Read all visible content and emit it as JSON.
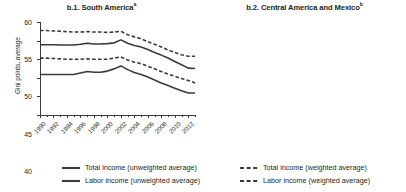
{
  "chart_data": [
    {
      "type": "line",
      "title": "b.1. South America",
      "title_superscript": "a",
      "xlabel": "",
      "ylabel": "Gini points, average",
      "ylim": [
        35,
        60
      ],
      "yticks": [
        35,
        40,
        45,
        50,
        55,
        60
      ],
      "xlim": [
        1990,
        2013
      ],
      "x": [
        1990,
        1991,
        1992,
        1993,
        1994,
        1995,
        1996,
        1997,
        1998,
        1999,
        2000,
        2001,
        2002,
        2003,
        2004,
        2005,
        2006,
        2007,
        2008,
        2009,
        2010,
        2011,
        2012,
        2013
      ],
      "xticks": [
        1990,
        1992,
        1994,
        1996,
        1998,
        2000,
        2002,
        2004,
        2006,
        2008,
        2010,
        2012
      ],
      "xtick_labels": [
        "1990",
        "1992",
        "1994",
        "1996",
        "1998",
        "2000",
        "2002",
        "2004",
        "2006",
        "2008",
        "2010",
        "2012"
      ],
      "grid": false,
      "legend_position": "below-figure",
      "series": [
        {
          "name": "Total income (unweighted average)",
          "style": "solid",
          "color": "#3a3a3a",
          "values": [
            53.9,
            53.9,
            53.9,
            53.8,
            53.8,
            53.8,
            54.0,
            54.3,
            54.1,
            54.1,
            54.2,
            54.4,
            55.2,
            54.3,
            53.7,
            53.3,
            52.6,
            51.8,
            51.1,
            50.3,
            49.4,
            48.5,
            47.6,
            47.5
          ]
        },
        {
          "name": "Total income (weighted average)",
          "style": "dashed",
          "color": "#3a3a3a",
          "values": [
            57.7,
            57.7,
            57.6,
            57.5,
            57.4,
            57.3,
            57.3,
            57.4,
            57.3,
            57.3,
            57.2,
            57.3,
            57.5,
            56.6,
            56.0,
            55.5,
            54.7,
            54.0,
            53.3,
            52.5,
            51.8,
            51.2,
            50.8,
            50.8
          ]
        },
        {
          "name": "Labor income (unweighted average)",
          "style": "solid",
          "color": "#3a3a3a",
          "values": [
            45.9,
            45.9,
            45.9,
            45.9,
            45.9,
            45.9,
            46.3,
            46.7,
            46.5,
            46.5,
            46.8,
            47.4,
            48.2,
            47.2,
            46.4,
            45.9,
            45.2,
            44.4,
            43.6,
            42.9,
            42.2,
            41.5,
            40.9,
            40.9
          ]
        },
        {
          "name": "Labor income (weighted average)",
          "style": "dashed",
          "color": "#3a3a3a",
          "values": [
            50.3,
            50.3,
            50.2,
            50.1,
            50.0,
            50.0,
            50.0,
            50.1,
            50.0,
            50.0,
            50.0,
            50.3,
            50.6,
            49.8,
            49.2,
            48.8,
            48.1,
            47.4,
            46.7,
            46.0,
            45.4,
            44.8,
            44.3,
            43.6
          ]
        }
      ]
    },
    {
      "type": "line",
      "title": "b.2. Central America and Mexico",
      "title_superscript": "b",
      "xlabel": "",
      "ylabel": "Gini points, average",
      "ylim": [
        35,
        60
      ],
      "yticks": [
        35,
        40,
        45,
        50,
        55,
        60
      ],
      "xlim": [
        1990,
        2013
      ],
      "x": [
        1990,
        1991,
        1992,
        1993,
        1994,
        1995,
        1996,
        1997,
        1998,
        1999,
        2000,
        2001,
        2002,
        2003,
        2004,
        2005,
        2006,
        2007,
        2008,
        2009,
        2010,
        2011,
        2012,
        2013
      ],
      "xticks": [
        1990,
        1992,
        1994,
        1996,
        1998,
        2000,
        2002,
        2004,
        2006,
        2008,
        2010,
        2012
      ],
      "xtick_labels": [
        "1990",
        "1992",
        "1994",
        "1996",
        "1998",
        "2000",
        "2002",
        "2004",
        "2006",
        "2008",
        "2010",
        "2012"
      ],
      "grid": false,
      "legend_position": "below-figure",
      "series": [
        {
          "name": "Total income (unweighted average)",
          "style": "solid",
          "color": "#3a3a3a",
          "values": [
            55.3,
            55.4,
            55.2,
            55.5,
            55.8,
            55.7,
            55.3,
            55.8,
            55.8,
            55.7,
            55.6,
            55.4,
            55.0,
            54.5,
            53.9,
            53.3,
            52.6,
            51.6,
            50.5,
            50.3,
            50.8,
            50.9,
            50.4,
            50.3
          ]
        },
        {
          "name": "Total income (weighted average)",
          "style": "dashed",
          "color": "#3a3a3a",
          "values": [
            53.8,
            53.9,
            54.0,
            54.3,
            54.8,
            54.8,
            54.5,
            54.6,
            54.5,
            54.4,
            54.2,
            53.6,
            52.7,
            52.0,
            51.5,
            51.2,
            51.0,
            50.5,
            49.8,
            48.9,
            49.3,
            49.8,
            49.7,
            49.8
          ]
        },
        {
          "name": "Labor income (unweighted average)",
          "style": "solid",
          "color": "#3a3a3a",
          "values": [
            46.8,
            46.8,
            46.9,
            47.5,
            48.4,
            47.7,
            47.3,
            48.0,
            47.8,
            47.6,
            48.1,
            47.7,
            47.4,
            47.2,
            46.9,
            46.3,
            45.6,
            44.7,
            43.6,
            42.8,
            42.6,
            42.9,
            43.1,
            43.6
          ]
        },
        {
          "name": "Labor income (weighted average)",
          "style": "dashed",
          "color": "#3a3a3a",
          "values": [
            46.6,
            46.7,
            46.9,
            47.4,
            48.0,
            47.5,
            47.2,
            47.8,
            47.7,
            47.6,
            48.0,
            47.8,
            47.5,
            47.3,
            47.0,
            46.4,
            45.7,
            44.8,
            43.7,
            43.0,
            42.9,
            43.1,
            43.3,
            43.4
          ]
        }
      ]
    }
  ],
  "legend": {
    "items": [
      {
        "label": "Total income (unweighted average)",
        "style": "solid"
      },
      {
        "label": "Total income (weighted average)",
        "style": "dashed"
      },
      {
        "label": "Labor income (unweighted average)",
        "style": "solid"
      },
      {
        "label": "Labor income (weighted average)",
        "style": "dashed"
      }
    ]
  }
}
